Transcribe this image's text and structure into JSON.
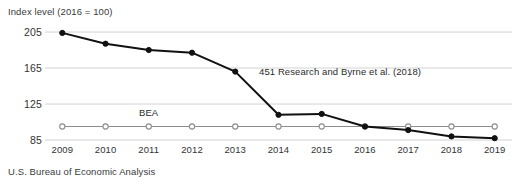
{
  "chart_data": {
    "type": "line",
    "title": "",
    "subtitle": "",
    "ylabel": "Index level (2016 = 100)",
    "xlabel": "",
    "source": "U.S. Bureau of Economic Analysis",
    "grid": true,
    "legend_position": "inline-annotation",
    "x": [
      2009,
      2010,
      2011,
      2012,
      2013,
      2014,
      2015,
      2016,
      2017,
      2018,
      2019
    ],
    "xticklabels": [
      "2009",
      "2010",
      "2011",
      "2012",
      "2013",
      "2014",
      "2015",
      "2016",
      "2017",
      "2018",
      "2019"
    ],
    "yticks": [
      85,
      125,
      165,
      205
    ],
    "yticklabels": [
      "85",
      "125",
      "165",
      "205"
    ],
    "ylim": [
      80,
      210
    ],
    "xlim": [
      2008.6,
      2019.4
    ],
    "series": [
      {
        "name": "451 Research and Byrne et al. (2018)",
        "color": "#111111",
        "marker": "filled-circle",
        "values": [
          204,
          192,
          185,
          182,
          161,
          113,
          114,
          100,
          96,
          89,
          87
        ]
      },
      {
        "name": "BEA",
        "color": "#8c8c8c",
        "marker": "open-circle",
        "values": [
          100,
          100,
          100,
          100,
          100,
          100,
          100,
          100,
          100,
          100,
          100
        ]
      }
    ],
    "annotations": [
      {
        "id": "ann-451",
        "text": "451 Research and Byrne et al. (2018)"
      },
      {
        "id": "ann-bea",
        "text": "BEA"
      }
    ]
  },
  "colors": {
    "grid": "#d2d2d2",
    "dark_series": "#111111",
    "light_series": "#8c8c8c",
    "text": "#333333",
    "background": "#ffffff"
  }
}
